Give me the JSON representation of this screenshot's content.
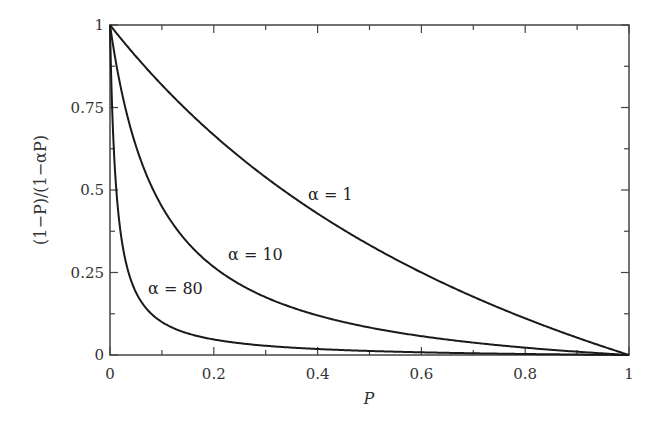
{
  "chart_data": {
    "type": "line",
    "title": "",
    "xlabel": "P",
    "ylabel": "(1−P)/(1−αP)",
    "xlim": [
      0,
      1
    ],
    "ylim": [
      0,
      1
    ],
    "grid": false,
    "legend": "inline curve labels",
    "x_ticks": [
      "0",
      "0.2",
      "0.4",
      "0.6",
      "0.8",
      "1"
    ],
    "y_ticks": [
      "0",
      "0.25",
      "0.5",
      "0.75",
      "1"
    ],
    "x": [
      0,
      0.01,
      0.02,
      0.05,
      0.1,
      0.2,
      0.3,
      0.4,
      0.5,
      0.6,
      0.7,
      0.8,
      0.9,
      1.0
    ],
    "series": [
      {
        "name": "α = 1",
        "label": "α = 1",
        "alpha": 1,
        "values": [
          1.0,
          0.98,
          0.961,
          0.905,
          0.818,
          0.667,
          0.538,
          0.429,
          0.333,
          0.25,
          0.176,
          0.111,
          0.053,
          0.0
        ]
      },
      {
        "name": "α = 10",
        "label": "α = 10",
        "alpha": 10,
        "values": [
          1.0,
          0.9,
          0.817,
          0.633,
          0.45,
          0.267,
          0.175,
          0.12,
          0.083,
          0.057,
          0.038,
          0.022,
          0.01,
          0.0
        ]
      },
      {
        "name": "α = 80",
        "label": "α = 80",
        "alpha": 80,
        "values": [
          1.0,
          0.55,
          0.377,
          0.19,
          0.1,
          0.047,
          0.028,
          0.018,
          0.012,
          0.008,
          0.005,
          0.003,
          0.001,
          0.0
        ]
      }
    ]
  }
}
